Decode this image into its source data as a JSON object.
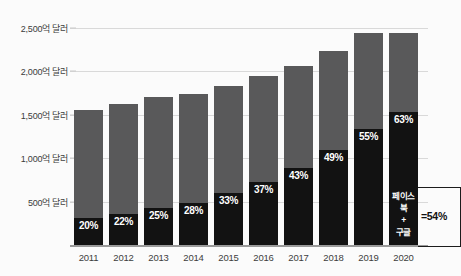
{
  "chart_data": {
    "type": "bar",
    "title": "",
    "subtitle": "",
    "xlabel": "",
    "ylabel": "",
    "categories": [
      "2011",
      "2012",
      "2013",
      "2014",
      "2015",
      "2016",
      "2017",
      "2018",
      "2019",
      "2020"
    ],
    "ylim": [
      0,
      2600
    ],
    "ytick_values": [
      500,
      1000,
      1500,
      2000,
      2500
    ],
    "ytick_labels": [
      "500억 달러",
      "1,000억 달러",
      "1,500억 달러",
      "2,000억 달러",
      "2,500억 달러"
    ],
    "grid": true,
    "legend_position": "none",
    "stacked": true,
    "series": [
      {
        "name": "페이스북 + 구글",
        "color": "#121212",
        "values": [
          312,
          358,
          425,
          489,
          604,
          722,
          886,
          1093,
          1342,
          1537
        ],
        "data_labels": [
          "20%",
          "22%",
          "25%",
          "28%",
          "33%",
          "37%",
          "43%",
          "49%",
          "55%",
          "63%"
        ]
      },
      {
        "name": "기타",
        "color": "#59595a",
        "values": [
          1248,
          1267,
          1275,
          1256,
          1226,
          1228,
          1174,
          1137,
          1098,
          903
        ]
      }
    ],
    "totals": [
      1560,
      1625,
      1700,
      1745,
      1830,
      1950,
      2060,
      2230,
      2440,
      2440
    ],
    "share_percent": [
      20,
      22,
      25,
      28,
      33,
      37,
      43,
      49,
      55,
      63
    ],
    "annotation": {
      "label_line1": "페이스북",
      "label_line2": "+",
      "label_line3": "구글",
      "value": "=54%"
    },
    "colors": {
      "black_segment": "#121212",
      "gray_segment": "#59595a",
      "background": "#fbfbfb",
      "gridline": "#d9d9d9",
      "axis": "#9a9a9a",
      "label_text": "#3b3b3b",
      "data_label_text": "#ffffff"
    }
  }
}
